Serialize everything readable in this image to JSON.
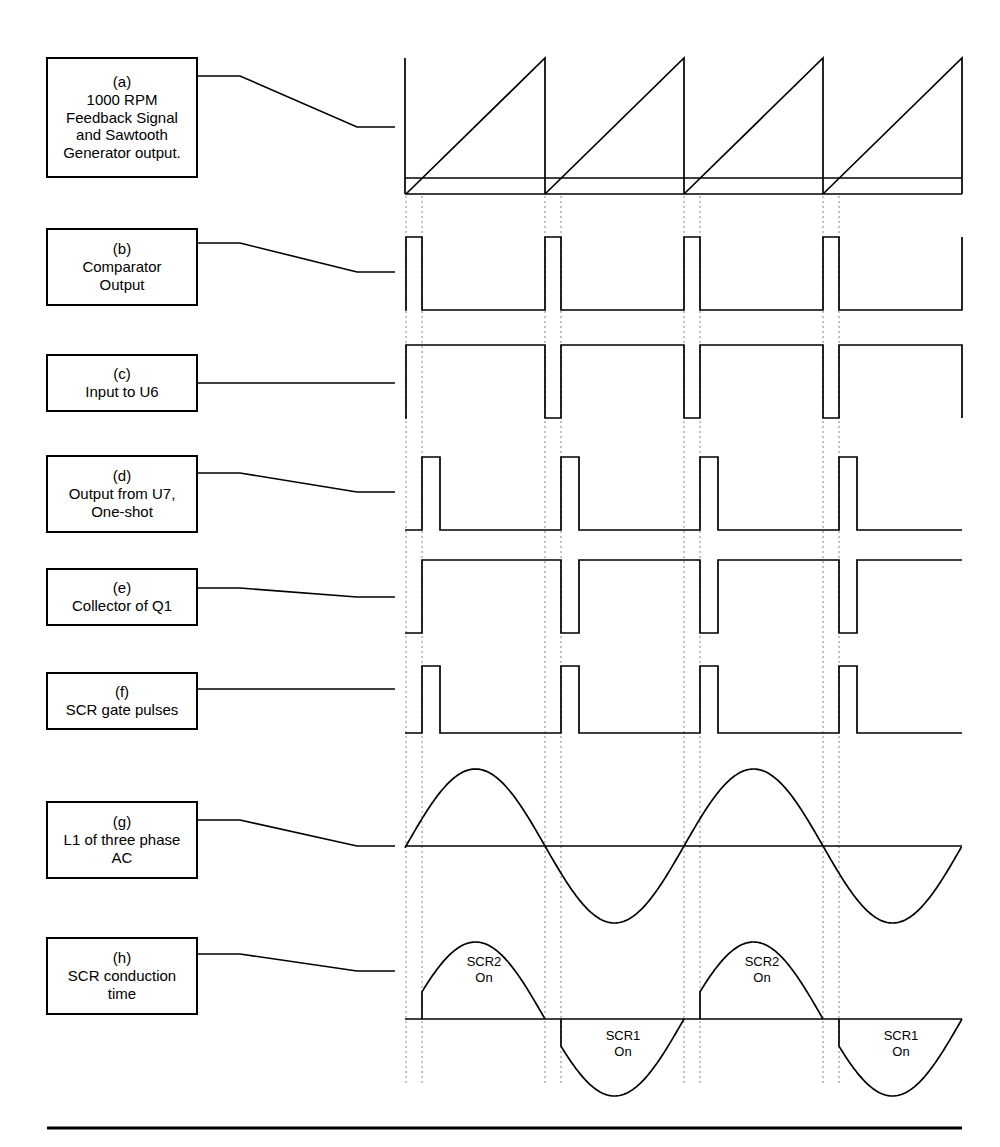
{
  "figure": {
    "stroke_color": "#000000",
    "background_color": "#ffffff",
    "dotted_color": "#999999",
    "bottom_rule": true
  },
  "labels": [
    {
      "tag": "(a)",
      "text": "1000 RPM\nFeedback Signal\nand Sawtooth\nGenerator output.",
      "box": {
        "x": 46,
        "y": 57,
        "w": 152,
        "h": 121
      }
    },
    {
      "tag": "(b)",
      "text": "Comparator\nOutput",
      "box": {
        "x": 46,
        "y": 228,
        "w": 152,
        "h": 78
      }
    },
    {
      "tag": "(c)",
      "text": "Input to U6",
      "box": {
        "x": 46,
        "y": 354,
        "w": 152,
        "h": 58
      }
    },
    {
      "tag": "(d)",
      "text": "Output from U7,\nOne-shot",
      "box": {
        "x": 46,
        "y": 455,
        "w": 152,
        "h": 78
      }
    },
    {
      "tag": "(e)",
      "text": "Collector of Q1",
      "box": {
        "x": 46,
        "y": 568,
        "w": 152,
        "h": 58
      }
    },
    {
      "tag": "(f)",
      "text": "SCR gate pulses",
      "box": {
        "x": 46,
        "y": 672,
        "w": 152,
        "h": 58
      }
    },
    {
      "tag": "(g)",
      "text": "L1 of three phase\nAC",
      "box": {
        "x": 46,
        "y": 801,
        "w": 152,
        "h": 78
      }
    },
    {
      "tag": "(h)",
      "text": "SCR conduction\ntime",
      "box": {
        "x": 46,
        "y": 937,
        "w": 152,
        "h": 78
      }
    }
  ],
  "leaders": [
    {
      "from": [
        198,
        76
      ],
      "to": [
        395,
        127
      ]
    },
    {
      "from": [
        198,
        243
      ],
      "to": [
        395,
        272
      ]
    },
    {
      "from": [
        198,
        383
      ],
      "to": [
        395,
        383
      ]
    },
    {
      "from": [
        198,
        473
      ],
      "to": [
        395,
        492
      ]
    },
    {
      "from": [
        198,
        588
      ],
      "to": [
        395,
        597
      ]
    },
    {
      "from": [
        198,
        689
      ],
      "to": [
        395,
        689
      ]
    },
    {
      "from": [
        198,
        820
      ],
      "to": [
        395,
        846
      ]
    },
    {
      "from": [
        198,
        954
      ],
      "to": [
        395,
        971
      ]
    }
  ],
  "chart_data": {
    "type": "line",
    "xlabel": "",
    "ylabel": "",
    "grid": false,
    "legend": "none",
    "plot_area": {
      "x_left": 405,
      "x_right": 962,
      "cycle_starts": [
        406,
        545,
        684,
        823
      ],
      "cycle_period": 139
    },
    "marker_lines": {
      "style": "dotted",
      "pairs": [
        [
          406,
          422
        ],
        [
          545,
          561
        ],
        [
          684,
          700
        ],
        [
          823,
          839
        ]
      ],
      "description": "Sawtooth reset / comparator trip reference lines"
    },
    "traces": [
      {
        "id": "a",
        "name": "1000 RPM Feedback Signal and Sawtooth Generator output.",
        "kind": "sawtooth-plus-dc",
        "baseline_y": 194,
        "top_y": 58,
        "dc_level_y": 178,
        "ramp_start_x": 406,
        "ramps": [
          [
            406,
            545
          ],
          [
            545,
            684
          ],
          [
            684,
            823
          ],
          [
            823,
            962
          ]
        ],
        "notes": "Rising ramps reset vertically at each cycle start; flat DC feedback line crosses ramp near bottom."
      },
      {
        "id": "b",
        "name": "Comparator Output",
        "kind": "pulse-high",
        "low_y": 310,
        "high_y": 237,
        "pulses": [
          [
            406,
            422
          ],
          [
            545,
            561
          ],
          [
            684,
            700
          ],
          [
            823,
            839
          ]
        ],
        "tail_high_at_right": true
      },
      {
        "id": "c",
        "name": "Input to U6",
        "kind": "pulse-low",
        "high_y": 345,
        "low_y": 418,
        "notches": [
          [
            406,
            422
          ],
          [
            545,
            561
          ],
          [
            684,
            700
          ],
          [
            823,
            839
          ]
        ],
        "tail_low_at_right": true
      },
      {
        "id": "d",
        "name": "Output from U7, One-shot",
        "kind": "pulse-high",
        "low_y": 530,
        "high_y": 457,
        "pulses": [
          [
            422,
            440
          ],
          [
            561,
            579
          ],
          [
            700,
            718
          ],
          [
            839,
            857
          ]
        ]
      },
      {
        "id": "e",
        "name": "Collector of Q1",
        "kind": "pulse-low",
        "high_y": 560,
        "low_y": 633,
        "notches": [
          [
            422,
            440
          ],
          [
            561,
            579
          ],
          [
            700,
            718
          ],
          [
            839,
            857
          ]
        ]
      },
      {
        "id": "f",
        "name": "SCR gate pulses",
        "kind": "pulse-high",
        "low_y": 733,
        "high_y": 666,
        "pulses": [
          [
            422,
            440
          ],
          [
            561,
            579
          ],
          [
            700,
            718
          ],
          [
            839,
            857
          ]
        ]
      },
      {
        "id": "g",
        "name": "L1 of three phase AC",
        "kind": "sine",
        "zero_y": 846,
        "amplitude": 77,
        "zero_crossings_x": [
          406,
          545,
          684,
          823,
          962
        ],
        "half_period": 139,
        "start_phase_rising": true
      },
      {
        "id": "h",
        "name": "SCR conduction time",
        "kind": "conduction-humps",
        "zero_y": 1019,
        "amplitude": 77,
        "humps": [
          {
            "label": "SCR2\nOn",
            "polarity": "positive",
            "from_x": 422,
            "to_x": 545,
            "text_x": 484,
            "text_y": 972
          },
          {
            "label": "SCR1\nOn",
            "polarity": "negative",
            "from_x": 561,
            "to_x": 684,
            "text_x": 623,
            "text_y": 1046
          },
          {
            "label": "SCR2\nOn",
            "polarity": "positive",
            "from_x": 700,
            "to_x": 823,
            "text_x": 762,
            "text_y": 972
          },
          {
            "label": "SCR1\nOn",
            "polarity": "negative",
            "from_x": 839,
            "to_x": 962,
            "text_x": 901,
            "text_y": 1046
          }
        ]
      }
    ],
    "annotations": [
      {
        "text": "SCR2",
        "x": 484,
        "y": 966
      },
      {
        "text": "On",
        "x": 484,
        "y": 982
      },
      {
        "text": "SCR1",
        "x": 623,
        "y": 1040
      },
      {
        "text": "On",
        "x": 623,
        "y": 1056
      },
      {
        "text": "SCR2",
        "x": 762,
        "y": 966
      },
      {
        "text": "On",
        "x": 762,
        "y": 982
      },
      {
        "text": "SCR1",
        "x": 901,
        "y": 1040
      },
      {
        "text": "On",
        "x": 901,
        "y": 1056
      }
    ]
  }
}
